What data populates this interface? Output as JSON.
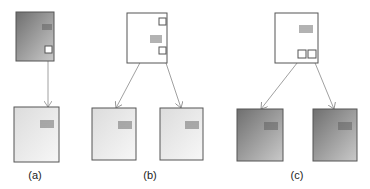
{
  "panels": [
    {
      "id": "a",
      "label": "(a)",
      "label_x": 35,
      "label_y": 169,
      "nodes": [
        {
          "name": "parent",
          "x": 16,
          "y": 12,
          "w": 38,
          "h": 49,
          "fill": "dark",
          "lines": {
            "x": 42,
            "y": 25,
            "w": 10,
            "n": 3
          },
          "ports": [
            {
              "x": 45,
              "y": 46,
              "s": 7
            }
          ]
        },
        {
          "name": "child",
          "x": 14,
          "y": 107,
          "w": 45,
          "h": 55,
          "fill": "light",
          "lines": {
            "x": 40,
            "y": 121,
            "w": 14,
            "n": 4
          },
          "ports": []
        }
      ],
      "edges": [
        {
          "x1": 48,
          "y1": 61,
          "x2": 48,
          "y2": 107
        }
      ]
    },
    {
      "id": "b",
      "label": "(b)",
      "label_x": 150,
      "label_y": 169,
      "nodes": [
        {
          "name": "parent",
          "x": 127,
          "y": 13,
          "w": 40,
          "h": 50,
          "fill": "white",
          "lines": {
            "x": 150,
            "y": 36,
            "w": 12,
            "n": 4
          },
          "ports": [
            {
              "x": 159,
              "y": 18,
              "s": 7
            },
            {
              "x": 159,
              "y": 47,
              "s": 7
            }
          ]
        },
        {
          "name": "child-left",
          "x": 92,
          "y": 108,
          "w": 44,
          "h": 52,
          "fill": "light",
          "lines": {
            "x": 118,
            "y": 122,
            "w": 14,
            "n": 4
          },
          "ports": []
        },
        {
          "name": "child-right",
          "x": 160,
          "y": 108,
          "w": 43,
          "h": 52,
          "fill": "light",
          "lines": {
            "x": 185,
            "y": 122,
            "w": 14,
            "n": 4
          },
          "ports": []
        }
      ],
      "edges": [
        {
          "x1": 160,
          "y1": 25,
          "x2": 116,
          "y2": 108
        },
        {
          "x1": 163,
          "y1": 54,
          "x2": 181,
          "y2": 108
        }
      ]
    },
    {
      "id": "c",
      "label": "(c)",
      "label_x": 297,
      "label_y": 169,
      "nodes": [
        {
          "name": "parent",
          "x": 275,
          "y": 13,
          "w": 43,
          "h": 50,
          "fill": "white",
          "lines": {
            "x": 299,
            "y": 26,
            "w": 14,
            "n": 4
          },
          "ports": [
            {
              "x": 298,
              "y": 50,
              "s": 8
            },
            {
              "x": 308,
              "y": 50,
              "s": 8
            }
          ]
        },
        {
          "name": "child-left",
          "x": 237,
          "y": 109,
          "w": 46,
          "h": 52,
          "fill": "dark",
          "lines": {
            "x": 264,
            "y": 123,
            "w": 14,
            "n": 4
          },
          "ports": []
        },
        {
          "name": "child-right",
          "x": 313,
          "y": 109,
          "w": 44,
          "h": 52,
          "fill": "dark",
          "lines": {
            "x": 338,
            "y": 123,
            "w": 14,
            "n": 4
          },
          "ports": []
        }
      ],
      "edges": [
        {
          "x1": 301,
          "y1": 58,
          "x2": 261,
          "y2": 109
        },
        {
          "x1": 313,
          "y1": 58,
          "x2": 334,
          "y2": 109
        }
      ]
    }
  ],
  "colors": {
    "stroke": "#555555",
    "edge": "#888888",
    "lines": "#555555"
  }
}
